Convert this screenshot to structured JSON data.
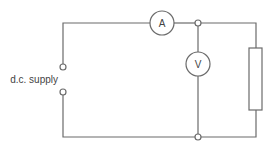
{
  "diagram": {
    "type": "circuit",
    "supply_label": "d.c. supply",
    "ammeter_label": "A",
    "voltmeter_label": "V",
    "colors": {
      "line": "#6b6b6b",
      "text": "#444444",
      "background": "#ffffff"
    }
  }
}
